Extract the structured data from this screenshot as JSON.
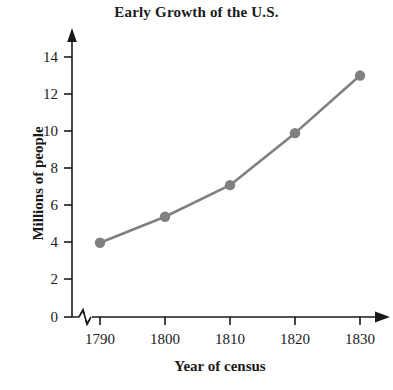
{
  "chart_data": {
    "type": "line",
    "title": "Early Growth of the U.S.",
    "xlabel": "Year of census",
    "ylabel": "Millions of people",
    "categories": [
      "1790",
      "1800",
      "1810",
      "1820",
      "1830"
    ],
    "x": [
      1790,
      1800,
      1810,
      1820,
      1830
    ],
    "values": [
      4.0,
      5.4,
      7.1,
      9.9,
      13.0
    ],
    "series": [
      {
        "name": "U.S. population",
        "values": [
          4.0,
          5.4,
          7.1,
          9.9,
          13.0
        ]
      }
    ],
    "xtick_labels": [
      "1790",
      "1800",
      "1810",
      "1820",
      "1830"
    ],
    "ytick_labels": [
      "0",
      "2",
      "4",
      "6",
      "8",
      "10",
      "12",
      "14"
    ],
    "yticks": [
      0,
      2,
      4,
      6,
      8,
      10,
      12,
      14
    ],
    "ylim": [
      0,
      15
    ],
    "xlim": [
      1790,
      1830
    ],
    "grid": false,
    "legend": false,
    "axis_break_x": true,
    "series_color": "#808080",
    "axis_color": "#1a1a1a",
    "marker": "circle",
    "background_color": "#ffffff"
  },
  "axes": {
    "y_title": "Millions of people",
    "x_title": "Year of census"
  }
}
